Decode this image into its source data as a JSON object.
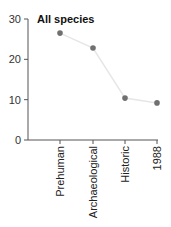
{
  "chart_data": {
    "type": "line",
    "title": "All species",
    "xlabel": "",
    "ylabel": "",
    "categories": [
      "Prehuman",
      "Archaeological",
      "Historic",
      "1988"
    ],
    "series": [
      {
        "name": "All species",
        "values": [
          26.5,
          22.8,
          10.4,
          9.2
        ]
      }
    ],
    "ylim": [
      0,
      30
    ],
    "yticks": [
      0,
      10,
      20,
      30
    ],
    "grid": false,
    "legend": "none",
    "colors": {
      "line": "#e6e6e6",
      "marker": "#707070",
      "axis": "#555555"
    }
  }
}
